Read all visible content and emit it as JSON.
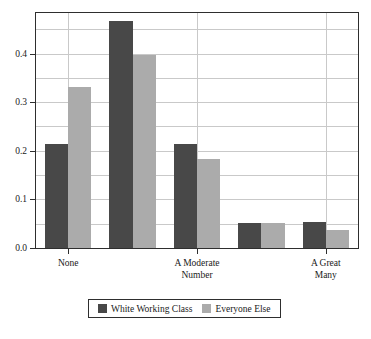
{
  "chart_data": {
    "type": "bar",
    "title": "",
    "subtitle": "",
    "xlabel": "",
    "ylabel": "",
    "categories": [
      "None",
      "",
      "A Moderate\nNumber",
      "",
      "A Great Many"
    ],
    "tick_labels": [
      "None",
      "A Moderate\nNumber",
      "A Great Many"
    ],
    "series": [
      {
        "name": "White Working Class",
        "color": "#484848",
        "values": [
          0.215,
          0.468,
          0.215,
          0.051,
          0.054
        ]
      },
      {
        "name": "Everyone Else",
        "color": "#ababab",
        "values": [
          0.331,
          0.398,
          0.183,
          0.052,
          0.037
        ]
      }
    ],
    "ylim": [
      0.0,
      0.4835
    ],
    "ytick_values": [
      0.0,
      0.1,
      0.2,
      0.3,
      0.4
    ],
    "ytick_labels": [
      "0.0",
      "0.1",
      "0.2",
      "0.3",
      "0.4"
    ],
    "gridlines_y": [
      0.05,
      0.1,
      0.15,
      0.2,
      0.25,
      0.3,
      0.35,
      0.4,
      0.45
    ],
    "gridlines_x_categories": [
      0,
      2,
      4
    ],
    "grid": true,
    "legend_position": "bottom-center",
    "frame": true
  },
  "legend": {
    "entries": [
      {
        "label": "White Working Class",
        "swatch": "dark-swatch"
      },
      {
        "label": "Everyone Else",
        "swatch": "light-swatch"
      }
    ]
  }
}
